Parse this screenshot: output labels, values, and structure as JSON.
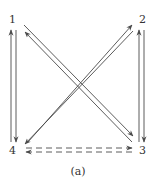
{
  "diagram": {
    "caption": "(a)",
    "colors": {
      "line": "#4a4a4a",
      "text": "#333333",
      "background": "#ffffff"
    },
    "nodes": [
      {
        "id": "1",
        "label": "1",
        "x": 13,
        "y": 20
      },
      {
        "id": "2",
        "label": "2",
        "x": 142,
        "y": 20
      },
      {
        "id": "3",
        "label": "3",
        "x": 142,
        "y": 150
      },
      {
        "id": "4",
        "label": "4",
        "x": 13,
        "y": 150
      }
    ],
    "edges": [
      {
        "from": "4",
        "to": "1",
        "style": "solid",
        "direction": "up"
      },
      {
        "from": "1",
        "to": "4",
        "style": "solid",
        "direction": "down"
      },
      {
        "from": "3",
        "to": "2",
        "style": "solid",
        "direction": "up"
      },
      {
        "from": "2",
        "to": "3",
        "style": "solid",
        "direction": "down"
      },
      {
        "from": "3",
        "to": "1",
        "style": "solid",
        "direction": "diagonal"
      },
      {
        "from": "1",
        "to": "3",
        "style": "solid",
        "direction": "diagonal"
      },
      {
        "from": "4",
        "to": "2",
        "style": "solid",
        "direction": "diagonal"
      },
      {
        "from": "2",
        "to": "4",
        "style": "solid",
        "direction": "diagonal"
      },
      {
        "from": "3",
        "to": "4",
        "style": "dashed",
        "direction": "left"
      },
      {
        "from": "4",
        "to": "3",
        "style": "dashed",
        "direction": "right"
      }
    ]
  }
}
